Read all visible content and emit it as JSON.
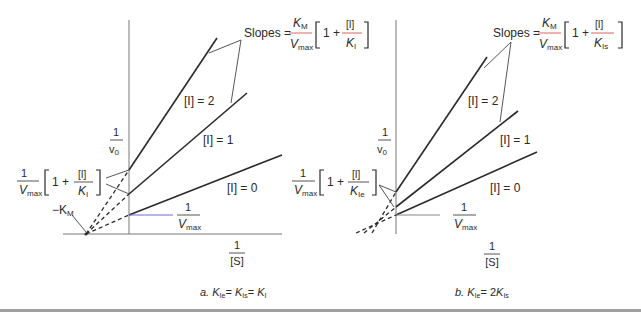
{
  "figure": {
    "panels": [
      {
        "id": "a",
        "caption_prefix": "a.",
        "caption": "K_Ie = K_Is = K_I",
        "caption_parts": {
          "k1": "K",
          "s1": "Ie",
          "eq1": "=",
          "k2": "K",
          "s2": "Is",
          "eq2": "=",
          "k3": "K",
          "s3": "I"
        },
        "y_axis_label": {
          "num": "1",
          "den": "v",
          "den_sub": "0"
        },
        "x_axis_label": {
          "num": "1",
          "den": "[S]"
        },
        "x_intercept_label": "−K",
        "x_intercept_sub": "M",
        "y_intercept_label": {
          "num": "1",
          "den": "V",
          "den_sub": "max"
        },
        "intercept_callout": {
          "num": "1",
          "den": "V",
          "den_sub": "max",
          "bracket_text": "1 +",
          "frac_num": "[I]",
          "frac_den": "K",
          "frac_den_sub": "I"
        },
        "slopes_label": {
          "prefix": "Slopes =",
          "num": "K",
          "num_sub": "M",
          "den": "V",
          "den_sub": "max",
          "bracket_text": "1 +",
          "frac_num": "[I]",
          "frac_den": "K",
          "frac_den_sub": "I"
        },
        "lines": [
          {
            "label": "[I] = 0"
          },
          {
            "label": "[I] = 1"
          },
          {
            "label": "[I] = 2"
          }
        ]
      },
      {
        "id": "b",
        "caption_prefix": "b.",
        "caption": "K_Ie = 2K_Is",
        "caption_parts": {
          "k1": "K",
          "s1": "Ie",
          "eq1": "= 2",
          "k2": "K",
          "s2": "Is"
        },
        "y_axis_label": {
          "num": "1",
          "den": "v",
          "den_sub": "0"
        },
        "x_axis_label": {
          "num": "1",
          "den": "[S]"
        },
        "y_intercept_label": {
          "num": "1",
          "den": "V",
          "den_sub": "max"
        },
        "intercept_callout": {
          "num": "1",
          "den": "V",
          "den_sub": "max",
          "bracket_text": "1 +",
          "frac_num": "[I]",
          "frac_den": "K",
          "frac_den_sub": "Ie"
        },
        "slopes_label": {
          "prefix": "Slopes =",
          "num": "K",
          "num_sub": "M",
          "den": "V",
          "den_sub": "max",
          "bracket_text": "1 +",
          "frac_num": "[I]",
          "frac_den": "K",
          "frac_den_sub": "Is"
        },
        "lines": [
          {
            "label": "[I] = 0"
          },
          {
            "label": "[I] = 1"
          },
          {
            "label": "[I] = 2"
          }
        ]
      }
    ],
    "colors": {
      "line": "#2a2a2a",
      "axis": "#777777",
      "fraction_bar": "#d9534f",
      "vmax_marker": "#6a6adf",
      "footer_rule": "#9a9a9a"
    }
  }
}
